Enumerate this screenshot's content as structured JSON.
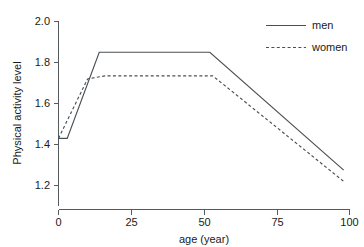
{
  "chart_data": {
    "type": "line",
    "title": "",
    "xlabel": "age (year)",
    "ylabel": "Physical activity level",
    "xlim": [
      0,
      100
    ],
    "ylim": [
      1.12,
      2.0
    ],
    "grid": false,
    "legend_position": "top-right",
    "xticks": [
      0,
      25,
      50,
      75,
      100
    ],
    "xtick_labels": [
      "0",
      "25",
      "50",
      "75",
      "100"
    ],
    "yticks": [
      1.2,
      1.4,
      1.6,
      1.8,
      2.0
    ],
    "ytick_labels": [
      "1.2",
      "1.4",
      "1.6",
      "1.8",
      "2.0"
    ],
    "series": [
      {
        "name": "men",
        "style": "solid",
        "color": "#4a4f53",
        "x": [
          0,
          3,
          14,
          52,
          98
        ],
        "values": [
          1.43,
          1.43,
          1.85,
          1.85,
          1.275
        ]
      },
      {
        "name": "women",
        "style": "dashed",
        "color": "#4a4f53",
        "x": [
          0,
          10,
          16,
          53,
          98
        ],
        "values": [
          1.43,
          1.72,
          1.735,
          1.735,
          1.22
        ]
      }
    ]
  },
  "legend": {
    "entries": [
      {
        "label": "men",
        "style": "solid"
      },
      {
        "label": "women",
        "style": "dashed"
      }
    ]
  },
  "axes": {
    "x_title": "age (year)",
    "y_title": "Physical activity level"
  },
  "top_cropped_text": ""
}
